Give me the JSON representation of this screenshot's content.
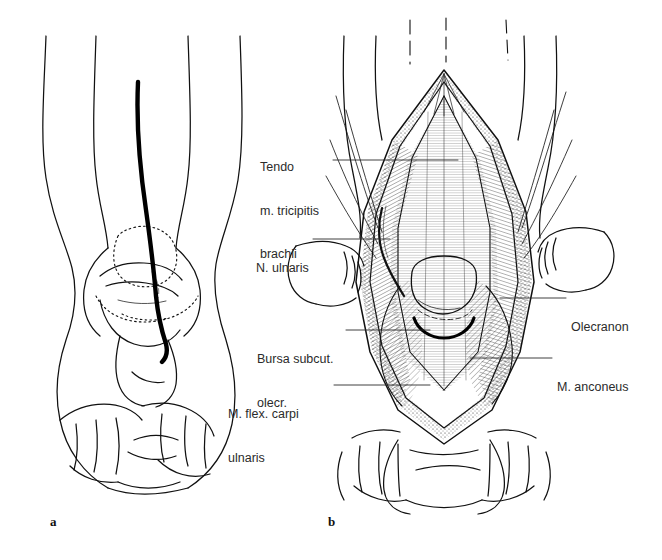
{
  "figure": {
    "title_caption_a": "a",
    "title_caption_b": "b",
    "background_color": "#ffffff",
    "ink_color": "#111111",
    "label_color": "#2b2b2b",
    "panels": [
      {
        "caption": "a",
        "description": "Posterior view of elbow with skin incision line marked, bony landmarks dotted",
        "labels": []
      },
      {
        "caption": "b",
        "description": "Surgical exposure of the olecranon region via posterior approach",
        "labels": [
          "Tendo m. tricipitis brachii",
          "N. ulnaris",
          "Bursa subcut. olecr.",
          "M. flex. carpi ulnaris",
          "Olecranon",
          "M. anconeus"
        ]
      }
    ]
  },
  "labels": {
    "tendo": {
      "line1": "Tendo",
      "line2": "m. tricipitis",
      "line3": "brachii"
    },
    "ulnaris": {
      "line1": "N. ulnaris"
    },
    "bursa": {
      "line1": "Bursa subcut.",
      "line2": "olecr."
    },
    "flexcarpi": {
      "line1": "M. flex. carpi",
      "line2": "ulnaris"
    },
    "olecranon": {
      "line1": "Olecranon"
    },
    "anconeus": {
      "line1": "M. anconeus"
    }
  }
}
